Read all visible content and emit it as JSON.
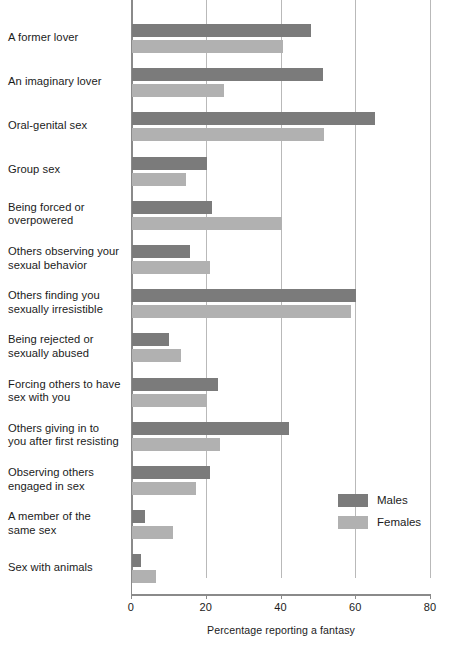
{
  "chart_data": {
    "type": "bar",
    "orientation": "horizontal",
    "title": "",
    "xlabel": "Percentage reporting a fantasy",
    "ylabel": "",
    "xlim": [
      0,
      80
    ],
    "xticks": [
      0,
      20,
      40,
      60,
      80
    ],
    "xtick_labels": [
      "0",
      "20",
      "40",
      "60",
      "80"
    ],
    "grid": true,
    "grid_axis": "x",
    "legend_position": "center-right",
    "categories": [
      "A former lover",
      "An imaginary lover",
      "Oral-genital sex",
      "Group sex",
      "Being forced or overpowered",
      "Others observing your sexual behavior",
      "Others finding you sexually irresistible",
      "Being rejected or sexually abused",
      "Forcing others to have sex with you",
      "Others giving in to you after first resisting",
      "Observing others engaged in sex",
      "A member of the same sex",
      "Sex with animals"
    ],
    "category_lines": [
      [
        "A former lover"
      ],
      [
        "An imaginary lover"
      ],
      [
        "Oral-genital sex"
      ],
      [
        "Group sex"
      ],
      [
        "Being forced or",
        "overpowered"
      ],
      [
        "Others observing your",
        "sexual behavior"
      ],
      [
        "Others finding you",
        "sexually irresistible"
      ],
      [
        "Being rejected or",
        "sexually abused"
      ],
      [
        "Forcing others to have",
        "sex with you"
      ],
      [
        "Others giving in to",
        "you after first resisting"
      ],
      [
        "Observing others",
        "engaged in sex"
      ],
      [
        "A member of the",
        "same sex"
      ],
      [
        "Sex with animals"
      ]
    ],
    "series": [
      {
        "name": "Males",
        "color": "#7b7b7b",
        "values": [
          48,
          51,
          65,
          20,
          21.5,
          15.5,
          60,
          10,
          23,
          42,
          21,
          3.5,
          2.5
        ]
      },
      {
        "name": "Females",
        "color": "#b1b1b1",
        "values": [
          40.5,
          24.5,
          51.5,
          14.5,
          40,
          21,
          58.5,
          13,
          20,
          23.5,
          17,
          11,
          6.5
        ]
      }
    ]
  },
  "legend": {
    "items": [
      {
        "label": "Males",
        "color": "#7b7b7b"
      },
      {
        "label": "Females",
        "color": "#b1b1b1"
      }
    ]
  },
  "axis": {
    "x_title": "Percentage reporting a fantasy"
  }
}
